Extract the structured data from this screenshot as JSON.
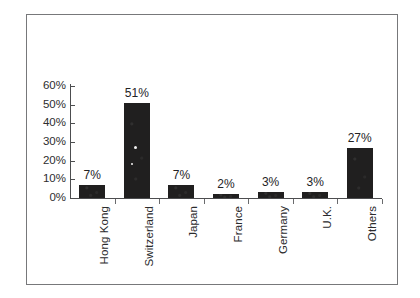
{
  "chart_data": {
    "type": "bar",
    "title": "",
    "subtitle": "",
    "xlabel": "",
    "ylabel": "",
    "categories": [
      "Hong Kong",
      "Switzerland",
      "Japan",
      "France",
      "Germany",
      "U.K.",
      "Others"
    ],
    "values": [
      7,
      51,
      7,
      2,
      3,
      3,
      27
    ],
    "value_labels": [
      "7%",
      "51%",
      "7%",
      "2%",
      "3%",
      "3%",
      "27%"
    ],
    "ylim": [
      0,
      60
    ],
    "ytick_values": [
      0,
      10,
      20,
      30,
      40,
      50,
      60
    ],
    "ytick_labels": [
      "0%",
      "10%",
      "20%",
      "30%",
      "40%",
      "50%",
      "60%"
    ],
    "grid": false,
    "legend": null,
    "legend_position": "none",
    "bar_color": "#201f1f",
    "axis_color": "#4c4d4f",
    "frame_color": "#77787a",
    "background_color": "#ffffff",
    "text_color": "#2b2b2d",
    "category_label_rotation": "-90deg",
    "annotations": []
  }
}
